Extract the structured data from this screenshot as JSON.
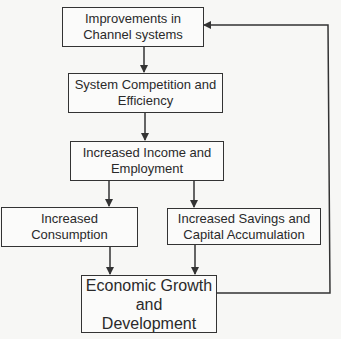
{
  "diagram": {
    "type": "flowchart",
    "nodes": [
      {
        "id": "improvements",
        "lines": [
          "Improvements in",
          "Channel systems"
        ]
      },
      {
        "id": "competition",
        "lines": [
          "System Competition and",
          "Efficiency"
        ]
      },
      {
        "id": "income",
        "lines": [
          "Increased Income and",
          "Employment"
        ]
      },
      {
        "id": "consumption",
        "lines": [
          "Increased",
          "Consumption"
        ]
      },
      {
        "id": "savings",
        "lines": [
          "Increased Savings and",
          "Capital Accumulation"
        ]
      },
      {
        "id": "growth",
        "lines": [
          "Economic Growth",
          "and",
          "Development"
        ]
      }
    ],
    "edges": [
      {
        "from": "improvements",
        "to": "competition"
      },
      {
        "from": "competition",
        "to": "income"
      },
      {
        "from": "income",
        "to": "consumption"
      },
      {
        "from": "income",
        "to": "savings"
      },
      {
        "from": "consumption",
        "to": "growth"
      },
      {
        "from": "savings",
        "to": "growth"
      },
      {
        "from": "growth",
        "to": "improvements",
        "style": "feedback-loop"
      }
    ],
    "colors": {
      "line": "#333333",
      "background": "#f7f7f5"
    }
  }
}
